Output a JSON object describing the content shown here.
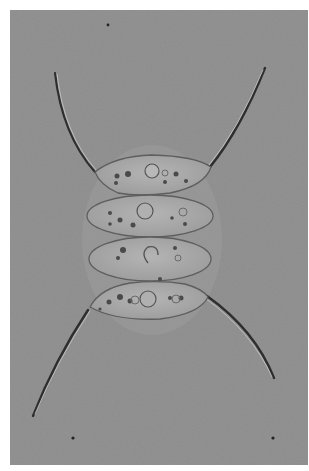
{
  "image": {
    "subject": "Four-celled green alga colony (coenobium) with four long spines, brightfield micrograph",
    "background_color": "#8f8f8f",
    "page_background": "#ffffff",
    "cell_count": 4,
    "spine_count": 4,
    "colors": {
      "cell_fill": "#a6a6a6",
      "cell_outline": "#5e5e5e",
      "spine": "#2e2e2e",
      "inclusion": "#4a4a4a"
    }
  }
}
